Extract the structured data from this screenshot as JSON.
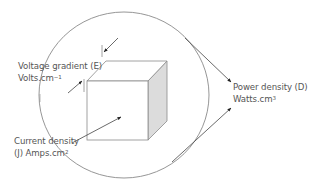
{
  "labels": {
    "voltage": {
      "line1": "Voltage gradient (E)",
      "line2_base": "Volts.cm",
      "line2_sup": "−1"
    },
    "current": {
      "line1": "Current density",
      "line2_base": "(J) Amps.cm",
      "line2_sup": "2"
    },
    "power": {
      "line1": "Power density (D)",
      "line2_base": "Watts.cm",
      "line2_sup": "3"
    }
  },
  "colors": {
    "line": "#808080",
    "arrow": "#333333",
    "side_face": "#d9d9d9",
    "text": "#555555"
  }
}
